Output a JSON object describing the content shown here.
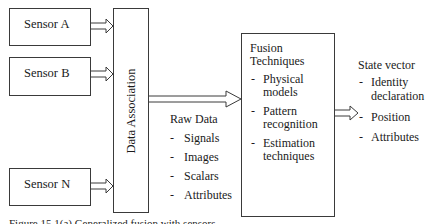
{
  "sensors": [
    {
      "label": "Sensor A"
    },
    {
      "label": "Sensor B"
    },
    {
      "label": "Sensor N"
    }
  ],
  "data_association": {
    "label": "Data Association"
  },
  "raw_data": {
    "title": "Raw Data",
    "items": [
      "Signals",
      "Images",
      "Scalars",
      "Attributes"
    ]
  },
  "fusion": {
    "title_line1": "Fusion",
    "title_line2": "Techniques",
    "items": [
      {
        "line1": "Physical",
        "line2": "models"
      },
      {
        "line1": "Pattern",
        "line2": "recognition"
      },
      {
        "line1": "Estimation",
        "line2": "techniques"
      }
    ]
  },
  "state_vector": {
    "title": "State vector",
    "items": [
      {
        "line1": "Identity",
        "line2": "declaration"
      },
      {
        "line1": "Position"
      },
      {
        "line1": "Attributes"
      }
    ]
  },
  "bullet": "-",
  "caption": "Figure 15.1(a) Generalized fusion with sensors"
}
